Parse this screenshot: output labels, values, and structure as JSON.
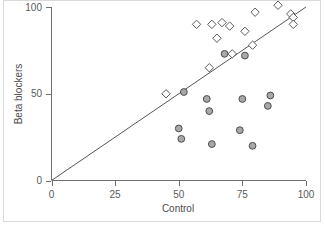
{
  "chart_data": {
    "type": "scatter",
    "title": "",
    "xlabel": "Control",
    "ylabel": "Beta blockers",
    "xlim": [
      0,
      100
    ],
    "ylim": [
      0,
      100
    ],
    "xticks": [
      0,
      25,
      50,
      75,
      100
    ],
    "yticks": [
      0,
      50,
      100
    ],
    "xtick_labels": [
      "0",
      "25",
      "50",
      "75",
      "100"
    ],
    "ytick_labels": [
      "0",
      "50",
      "100"
    ],
    "grid": false,
    "legend": null,
    "annotations": [
      {
        "name": "identity-line",
        "description": "line of equality through origin with slope 1",
        "from": [
          0,
          0
        ],
        "to": [
          100,
          100
        ]
      }
    ],
    "series": [
      {
        "name": "open-diamonds",
        "marker": "diamond",
        "fill": "#ffffff",
        "stroke": "#5a5a5a",
        "points": [
          [
            45,
            50
          ],
          [
            57,
            90
          ],
          [
            62,
            65
          ],
          [
            63,
            90
          ],
          [
            65,
            82
          ],
          [
            67,
            91
          ],
          [
            70,
            89
          ],
          [
            71,
            73
          ],
          [
            76,
            86
          ],
          [
            79,
            78
          ],
          [
            80,
            97
          ],
          [
            89,
            101
          ],
          [
            94,
            96
          ],
          [
            95,
            94
          ],
          [
            95,
            90
          ]
        ]
      },
      {
        "name": "filled-circles",
        "marker": "circle",
        "fill": "#a8a8a8",
        "stroke": "#4d4d4d",
        "points": [
          [
            50,
            30
          ],
          [
            51,
            24
          ],
          [
            52,
            51
          ],
          [
            61,
            47
          ],
          [
            62,
            40
          ],
          [
            63,
            21
          ],
          [
            68,
            73
          ],
          [
            74,
            29
          ],
          [
            75,
            47
          ],
          [
            76,
            72
          ],
          [
            79,
            20
          ],
          [
            85,
            43
          ],
          [
            86,
            49
          ]
        ]
      }
    ]
  },
  "axes": {
    "x_title": "Control",
    "y_title": "Beta blockers"
  }
}
